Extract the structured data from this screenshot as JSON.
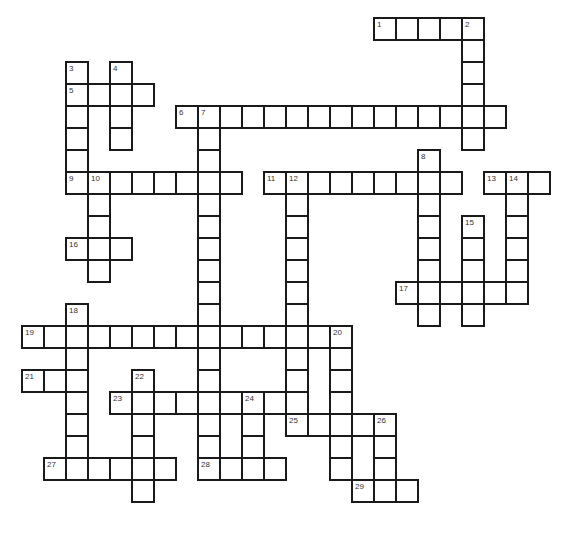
{
  "puzzle": {
    "type": "crossword",
    "grid_origin": {
      "x": 22,
      "y": 18
    },
    "cell_size": 22,
    "border_color": "#1a1a1a",
    "entries": [
      {
        "number": "1",
        "row": 0,
        "col": 16,
        "direction": "across",
        "length": 5
      },
      {
        "number": "2",
        "row": 0,
        "col": 20,
        "direction": "down",
        "length": 6
      },
      {
        "number": "3",
        "row": 2,
        "col": 2,
        "direction": "down",
        "length": 6
      },
      {
        "number": "4",
        "row": 2,
        "col": 4,
        "direction": "down",
        "length": 4
      },
      {
        "number": "5",
        "row": 3,
        "col": 2,
        "direction": "across",
        "length": 4
      },
      {
        "number": "6",
        "row": 4,
        "col": 7,
        "direction": "across",
        "length": 15
      },
      {
        "number": "7",
        "row": 4,
        "col": 8,
        "direction": "down",
        "length": 16
      },
      {
        "number": "8",
        "row": 6,
        "col": 18,
        "direction": "down",
        "length": 8
      },
      {
        "number": "9",
        "row": 7,
        "col": 2,
        "direction": "across",
        "length": 8
      },
      {
        "number": "10",
        "row": 7,
        "col": 3,
        "direction": "down",
        "length": 5
      },
      {
        "number": "11",
        "row": 7,
        "col": 11,
        "direction": "across",
        "length": 9
      },
      {
        "number": "12",
        "row": 7,
        "col": 12,
        "direction": "down",
        "length": 11
      },
      {
        "number": "13",
        "row": 7,
        "col": 21,
        "direction": "across",
        "length": 3
      },
      {
        "number": "14",
        "row": 7,
        "col": 22,
        "direction": "down",
        "length": 6
      },
      {
        "number": "15",
        "row": 9,
        "col": 20,
        "direction": "down",
        "length": 5
      },
      {
        "number": "16",
        "row": 10,
        "col": 2,
        "direction": "across",
        "length": 3
      },
      {
        "number": "17",
        "row": 12,
        "col": 17,
        "direction": "across",
        "length": 6
      },
      {
        "number": "18",
        "row": 13,
        "col": 2,
        "direction": "down",
        "length": 7
      },
      {
        "number": "19",
        "row": 14,
        "col": 0,
        "direction": "across",
        "length": 15
      },
      {
        "number": "20",
        "row": 14,
        "col": 14,
        "direction": "down",
        "length": 7
      },
      {
        "number": "21",
        "row": 16,
        "col": 0,
        "direction": "across",
        "length": 3
      },
      {
        "number": "22",
        "row": 16,
        "col": 5,
        "direction": "down",
        "length": 6
      },
      {
        "number": "23",
        "row": 17,
        "col": 4,
        "direction": "across",
        "length": 9
      },
      {
        "number": "24",
        "row": 17,
        "col": 10,
        "direction": "down",
        "length": 4
      },
      {
        "number": "25",
        "row": 18,
        "col": 12,
        "direction": "across",
        "length": 5
      },
      {
        "number": "26",
        "row": 18,
        "col": 16,
        "direction": "down",
        "length": 4
      },
      {
        "number": "27",
        "row": 20,
        "col": 1,
        "direction": "across",
        "length": 6
      },
      {
        "number": "28",
        "row": 20,
        "col": 8,
        "direction": "across",
        "length": 4
      },
      {
        "number": "29",
        "row": 21,
        "col": 15,
        "direction": "across",
        "length": 3
      }
    ]
  }
}
